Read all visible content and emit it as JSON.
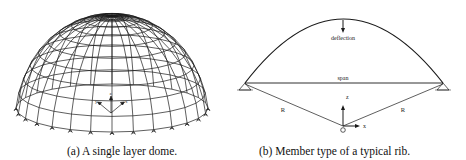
{
  "figure": {
    "panel_a": {
      "caption": "(a) A single layer dome.",
      "axis_labels": {
        "z": "z",
        "x": "x",
        "y": "y"
      },
      "rings": 10,
      "meridians": 28
    },
    "panel_b": {
      "caption": "(b) Member type of a typical rib.",
      "labels": {
        "deflection": "deflection",
        "span": "span",
        "radius_left": "R",
        "radius_right": "R",
        "origin": "O",
        "z_axis": "z",
        "x_axis": "x"
      }
    }
  },
  "colors": {
    "line": "#1a1a1a",
    "background": "#ffffff"
  }
}
